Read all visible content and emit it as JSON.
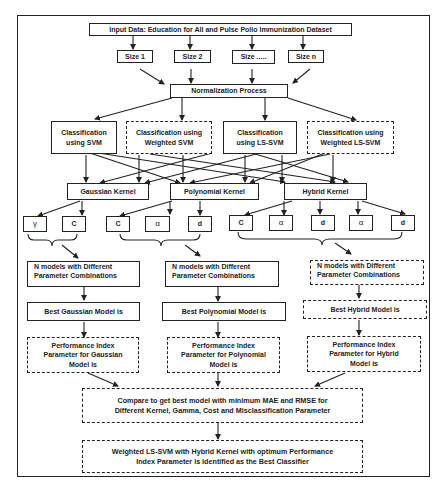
{
  "diagram": {
    "input": "Input Data: Education for All and Pulse Polio Immunization Dataset",
    "sizes": [
      "Size 1",
      "Size 2",
      "Size .....",
      "Size n"
    ],
    "normalization": "Normalization Process",
    "classifiers": [
      {
        "label": "Classification using SVM",
        "line1": "Classification",
        "line2": "using SVM",
        "style": "solid"
      },
      {
        "label": "Classification using Weighted SVM",
        "line1": "Classification using",
        "line2": "Weighted SVM",
        "style": "dashed"
      },
      {
        "label": "Classification using LS-SVM",
        "line1": "Classification",
        "line2": "using LS-SVM",
        "style": "solid"
      },
      {
        "label": "Classification using Weighted LS-SVM",
        "line1": "Classification using",
        "line2": "Weighted LS-SVM",
        "style": "dashed"
      }
    ],
    "kernels": [
      "Gaussian Kernel",
      "Polynomial Kernel",
      "Hybrid Kernel"
    ],
    "parameters": {
      "gaussian": [
        "γ",
        "C"
      ],
      "polynomial": [
        "C",
        "α",
        "d"
      ],
      "hybrid": [
        "C",
        "α",
        "d",
        "α",
        "d"
      ]
    },
    "n_models": {
      "line1": "N models with Different",
      "line2": "Parameter Combinations"
    },
    "best_models": [
      "Best Gaussian Model is",
      "Best Polynomial Model is",
      "Best Hybrid Model is"
    ],
    "performance": [
      {
        "line1": "Performance Index",
        "line2": "Parameter for Gaussian",
        "line3": "Model is"
      },
      {
        "line1": "Performance Index",
        "line2": "Parameter for Polynomial",
        "line3": "Model is"
      },
      {
        "line1": "Performance Index",
        "line2": "Parameter for Hybrid",
        "line3": "Model is"
      }
    ],
    "compare": {
      "line1": "Compare to get best model with minimum MAE and RMSE for",
      "line2": "Different Kernel, Gamma, Cost and Misclassification Parameter"
    },
    "result": {
      "line1": "Weighted LS-SVM with Hybrid Kernel with optimum Performance",
      "line2": "Index Parameter is identified as the Best Classifier"
    }
  },
  "colors": {
    "line": "#222222",
    "background": "#ffffff"
  }
}
